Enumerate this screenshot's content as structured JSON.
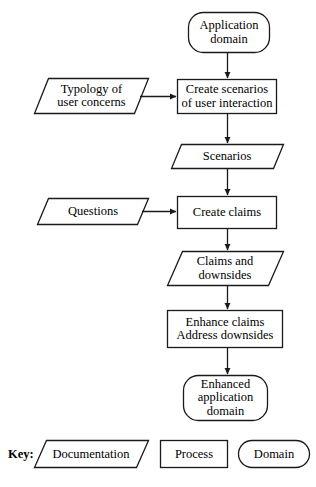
{
  "diagram": {
    "stroke_color": "#1a1a1a",
    "fill_color": "#ffffff",
    "background_color": "#ffffff",
    "nodes": [
      {
        "id": "application-domain",
        "shape": "domain",
        "lines": [
          "Application",
          "domain"
        ],
        "text": "Application domain",
        "x": 188,
        "y": 12,
        "w": 82,
        "h": 41
      },
      {
        "id": "create-scenarios",
        "shape": "process",
        "lines": [
          "Create scenarios",
          "of user interaction"
        ],
        "text": "Create scenarios of user interaction",
        "x": 177,
        "y": 79,
        "w": 100,
        "h": 35
      },
      {
        "id": "typology-of-user-concerns",
        "shape": "documentation",
        "lines": [
          "Typology of",
          "user concerns"
        ],
        "text": "Typology of user concerns",
        "x": 35,
        "y": 78,
        "w": 113,
        "h": 36
      },
      {
        "id": "scenarios",
        "shape": "documentation",
        "lines": [
          "Scenarios"
        ],
        "text": "Scenarios",
        "x": 171,
        "y": 144,
        "w": 112,
        "h": 25
      },
      {
        "id": "create-claims",
        "shape": "process",
        "lines": [
          "Create claims"
        ],
        "text": "Create claims",
        "x": 177,
        "y": 196,
        "w": 100,
        "h": 33
      },
      {
        "id": "questions",
        "shape": "documentation",
        "lines": [
          "Questions"
        ],
        "text": "Questions",
        "x": 37,
        "y": 198,
        "w": 112,
        "h": 27
      },
      {
        "id": "claims-and-downsides",
        "shape": "documentation",
        "lines": [
          "Claims and",
          "downsides"
        ],
        "text": "Claims and downsides",
        "x": 168,
        "y": 251,
        "w": 115,
        "h": 35
      },
      {
        "id": "enhance-claims",
        "shape": "process",
        "lines": [
          "Enhance claims",
          "Address downsides"
        ],
        "text": "Enhance claims Address downsides",
        "x": 167,
        "y": 310,
        "w": 116,
        "h": 38
      },
      {
        "id": "enhanced-application-domain",
        "shape": "domain",
        "lines": [
          "Enhanced",
          "application",
          "domain"
        ],
        "text": "Enhanced application domain",
        "x": 183,
        "y": 375,
        "w": 85,
        "h": 46
      }
    ],
    "connectors": [
      {
        "id": "app-domain-to-create-scenarios",
        "from": "application-domain",
        "to": "create-scenarios",
        "direction": "down"
      },
      {
        "id": "typology-to-create-scenarios",
        "from": "typology-of-user-concerns",
        "to": "create-scenarios",
        "direction": "right"
      },
      {
        "id": "create-scenarios-to-scenarios",
        "from": "create-scenarios",
        "to": "scenarios",
        "direction": "down"
      },
      {
        "id": "scenarios-to-create-claims",
        "from": "scenarios",
        "to": "create-claims",
        "direction": "down"
      },
      {
        "id": "questions-to-create-claims",
        "from": "questions",
        "to": "create-claims",
        "direction": "right"
      },
      {
        "id": "create-claims-to-claims-downsides",
        "from": "create-claims",
        "to": "claims-and-downsides",
        "direction": "down"
      },
      {
        "id": "claims-downsides-to-enhance",
        "from": "claims-and-downsides",
        "to": "enhance-claims",
        "direction": "down"
      },
      {
        "id": "enhance-to-enhanced-domain",
        "from": "enhance-claims",
        "to": "enhanced-application-domain",
        "direction": "down"
      }
    ]
  },
  "legend": {
    "key_label": "Key:",
    "items": [
      {
        "id": "legend-documentation",
        "shape": "documentation",
        "label": "Documentation",
        "x": 35,
        "y": 440,
        "w": 113,
        "h": 28
      },
      {
        "id": "legend-process",
        "shape": "process",
        "label": "Process",
        "x": 160,
        "y": 440,
        "w": 68,
        "h": 28
      },
      {
        "id": "legend-domain",
        "shape": "domain",
        "label": "Domain",
        "x": 238,
        "y": 440,
        "w": 72,
        "h": 28
      }
    ]
  }
}
